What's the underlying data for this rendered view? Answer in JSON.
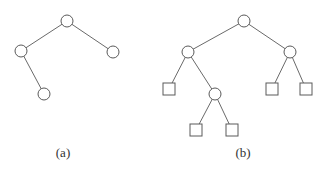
{
  "figures": [
    {
      "id": "a",
      "caption": "(a)",
      "caption_pos": {
        "x": 63,
        "y": 145
      },
      "nodes": [
        {
          "id": "a0",
          "shape": "circle",
          "x": 67,
          "y": 21
        },
        {
          "id": "a1",
          "shape": "circle",
          "x": 21,
          "y": 51
        },
        {
          "id": "a2",
          "shape": "circle",
          "x": 113,
          "y": 52
        },
        {
          "id": "a3",
          "shape": "circle",
          "x": 44,
          "y": 94
        }
      ],
      "edges": [
        [
          "a0",
          "a1"
        ],
        [
          "a0",
          "a2"
        ],
        [
          "a1",
          "a3"
        ]
      ]
    },
    {
      "id": "b",
      "caption": "(b)",
      "caption_pos": {
        "x": 243,
        "y": 145
      },
      "nodes": [
        {
          "id": "b0",
          "shape": "circle",
          "x": 244,
          "y": 21
        },
        {
          "id": "b1",
          "shape": "circle",
          "x": 188,
          "y": 52
        },
        {
          "id": "b2",
          "shape": "circle",
          "x": 290,
          "y": 52
        },
        {
          "id": "b3",
          "shape": "square",
          "x": 169,
          "y": 89
        },
        {
          "id": "b4",
          "shape": "circle",
          "x": 215,
          "y": 94
        },
        {
          "id": "b5",
          "shape": "square",
          "x": 196,
          "y": 130
        },
        {
          "id": "b6",
          "shape": "square",
          "x": 232,
          "y": 130
        },
        {
          "id": "b7",
          "shape": "square",
          "x": 272,
          "y": 89
        },
        {
          "id": "b8",
          "shape": "square",
          "x": 306,
          "y": 89
        }
      ],
      "edges": [
        [
          "b0",
          "b1"
        ],
        [
          "b0",
          "b2"
        ],
        [
          "b1",
          "b3"
        ],
        [
          "b1",
          "b4"
        ],
        [
          "b4",
          "b5"
        ],
        [
          "b4",
          "b6"
        ],
        [
          "b2",
          "b7"
        ],
        [
          "b2",
          "b8"
        ]
      ]
    }
  ],
  "style": {
    "circle_radius": 6,
    "square_size": 12,
    "line_color": "#6a6a6a",
    "node_stroke": "#5a5a5a"
  }
}
